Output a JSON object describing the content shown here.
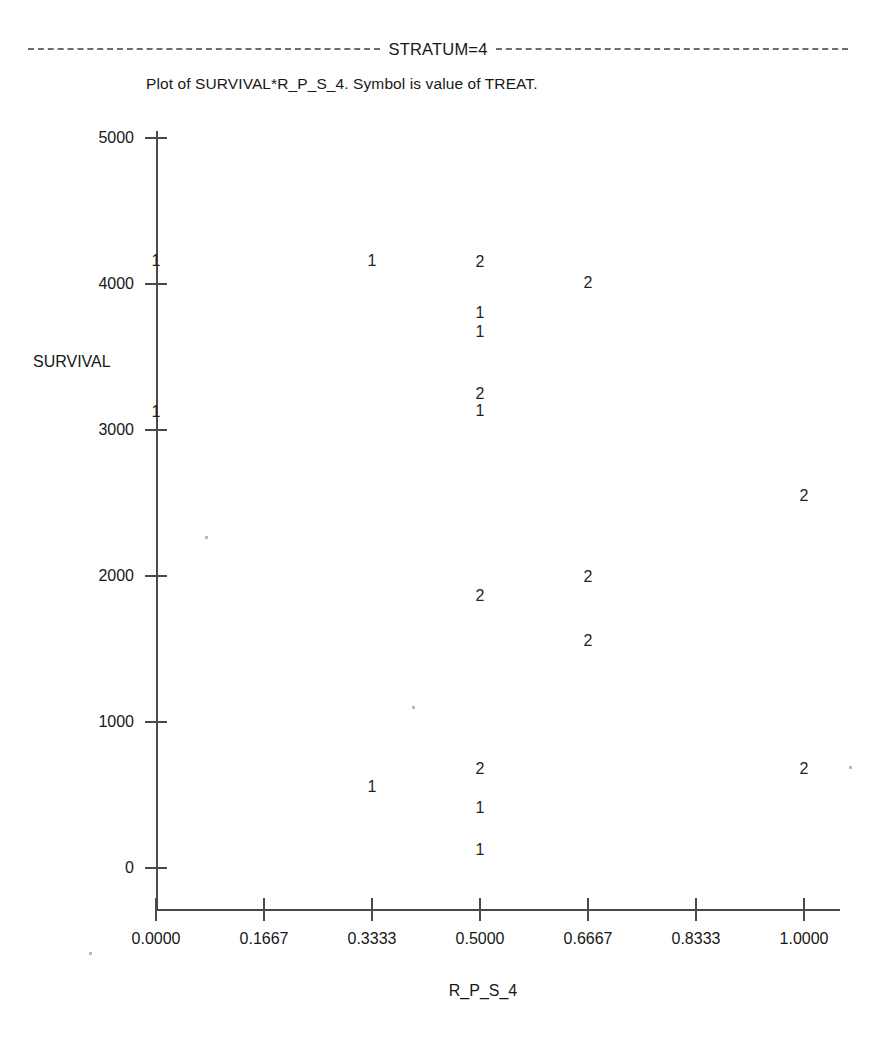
{
  "header": {
    "stratum_label": "STRATUM=4"
  },
  "caption": "Plot of SURVIVAL*R_P_S_4.  Symbol is value of TREAT.",
  "axes": {
    "y_title": "SURVIVAL",
    "x_title": "R_P_S_4",
    "y_ticks": [
      "5000",
      "4000",
      "3000",
      "2000",
      "1000",
      "0"
    ],
    "x_ticks": [
      "0.0000",
      "0.1667",
      "0.3333",
      "0.5000",
      "0.6667",
      "0.8333",
      "1.0000"
    ]
  },
  "chart_data": {
    "type": "scatter",
    "title": "Plot of SURVIVAL*R_P_S_4.  Symbol is value of TREAT.",
    "subtitle": "STRATUM=4",
    "xlabel": "R_P_S_4",
    "ylabel": "SURVIVAL",
    "xlim": [
      0.0,
      1.0
    ],
    "ylim": [
      0,
      5000
    ],
    "xticks": [
      0.0,
      0.1667,
      0.3333,
      0.5,
      0.6667,
      0.8333,
      1.0
    ],
    "yticks": [
      0,
      1000,
      2000,
      3000,
      4000,
      5000
    ],
    "grid": false,
    "legend": "none",
    "symbol_variable": "TREAT",
    "symbols": [
      "1",
      "2"
    ],
    "points": [
      {
        "x": 0.0,
        "y": 4160,
        "symbol": "1"
      },
      {
        "x": 0.3333,
        "y": 4160,
        "symbol": "1"
      },
      {
        "x": 0.5,
        "y": 4150,
        "symbol": "2"
      },
      {
        "x": 0.6667,
        "y": 4010,
        "symbol": "2"
      },
      {
        "x": 0.5,
        "y": 3800,
        "symbol": "1"
      },
      {
        "x": 0.5,
        "y": 3670,
        "symbol": "1"
      },
      {
        "x": 0.5,
        "y": 3250,
        "symbol": "2"
      },
      {
        "x": 0.5,
        "y": 3130,
        "symbol": "1"
      },
      {
        "x": 0.0,
        "y": 3120,
        "symbol": "1"
      },
      {
        "x": 1.0,
        "y": 2550,
        "symbol": "2"
      },
      {
        "x": 0.6667,
        "y": 1990,
        "symbol": "2"
      },
      {
        "x": 0.5,
        "y": 1860,
        "symbol": "2"
      },
      {
        "x": 0.6667,
        "y": 1555,
        "symbol": "2"
      },
      {
        "x": 0.5,
        "y": 680,
        "symbol": "2"
      },
      {
        "x": 1.0,
        "y": 680,
        "symbol": "2"
      },
      {
        "x": 0.3333,
        "y": 555,
        "symbol": "1"
      },
      {
        "x": 0.5,
        "y": 410,
        "symbol": "1"
      },
      {
        "x": 0.5,
        "y": 120,
        "symbol": "1"
      }
    ]
  }
}
